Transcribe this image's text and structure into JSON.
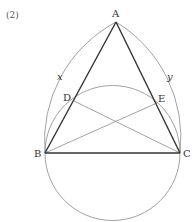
{
  "figure": {
    "problem_number": "(2)",
    "points": {
      "A": {
        "label": "A",
        "x": 116,
        "y": 22
      },
      "B": {
        "label": "B",
        "x": 45,
        "y": 153
      },
      "C": {
        "label": "C",
        "x": 180,
        "y": 153
      },
      "D": {
        "label": "D",
        "x": 74,
        "y": 101
      },
      "E": {
        "label": "E",
        "x": 157,
        "y": 103
      }
    },
    "arc_labels": {
      "x": "x",
      "y": "y"
    },
    "colors": {
      "thick_line": "#333333",
      "thin_line": "#8a8a8a",
      "text": "#333333"
    }
  }
}
